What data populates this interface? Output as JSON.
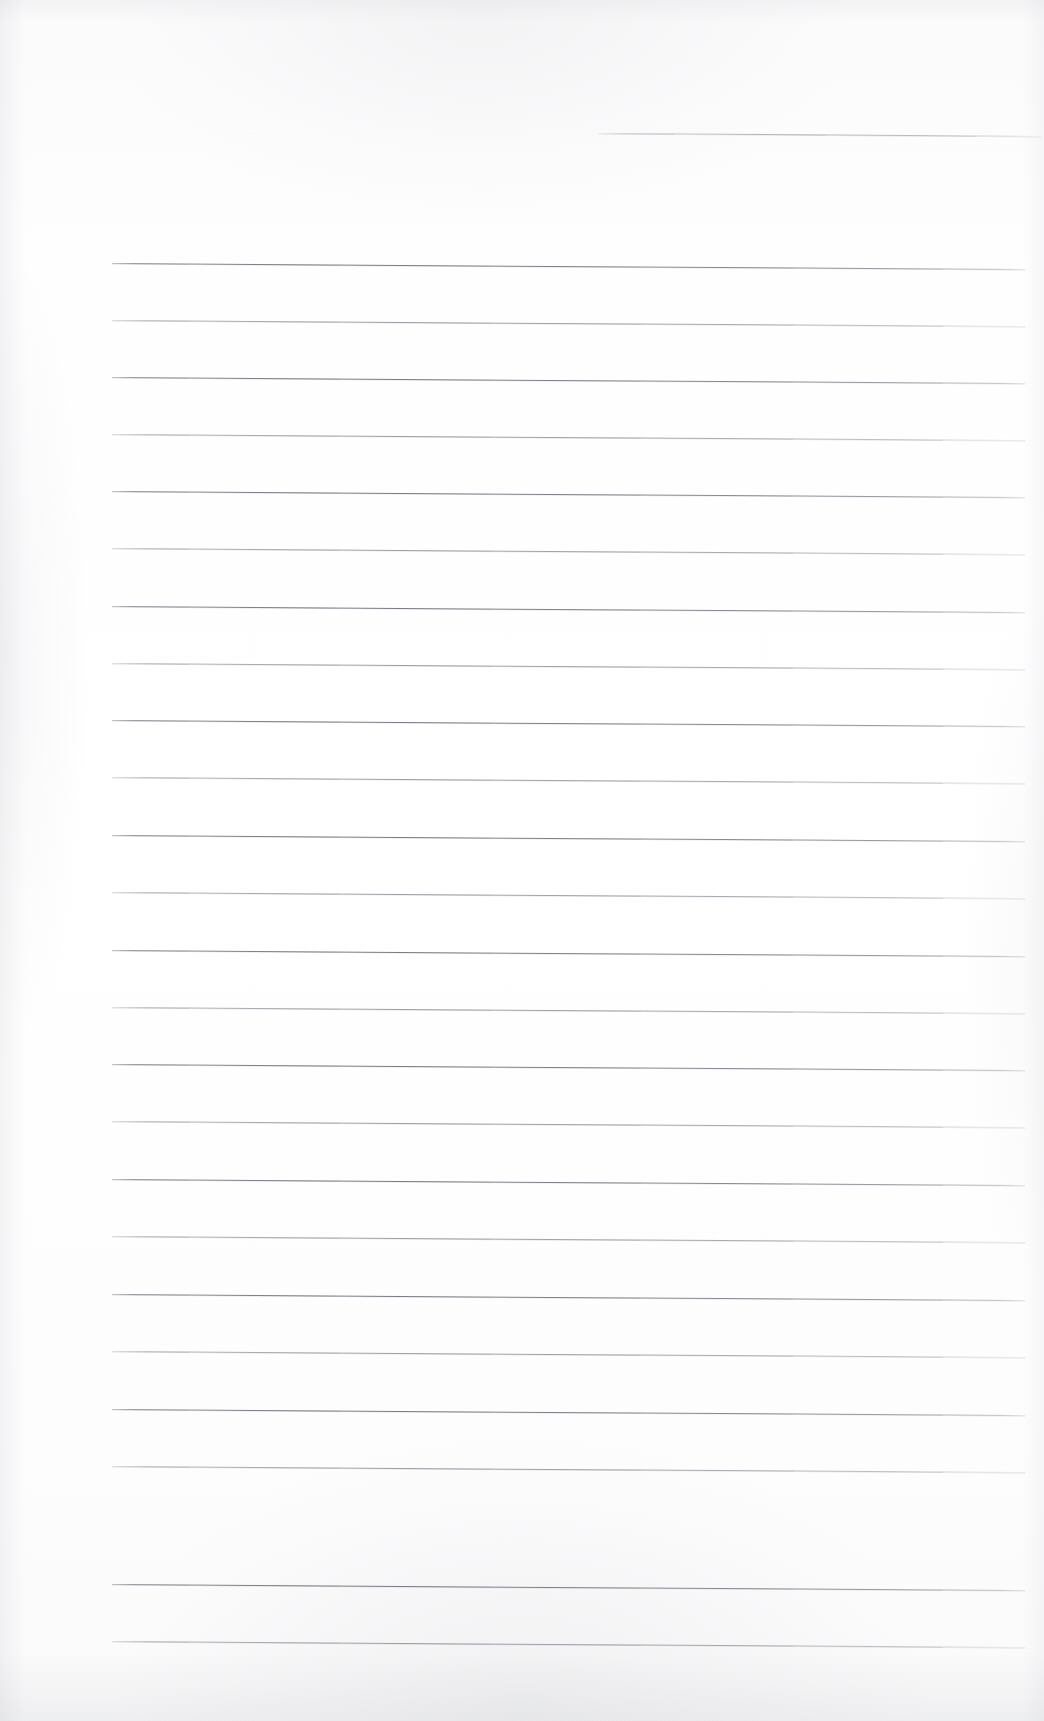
{
  "document": {
    "kind": "scanned-blank-lined-page",
    "page_width": 1044,
    "page_height": 1721,
    "background_color": "#fdfdfe",
    "rule_color": "#82838b",
    "visible_text": "",
    "handwriting": "",
    "notes_text": ""
  },
  "ruling": {
    "line_count": 25,
    "first_line_y": 133,
    "body_first_line_y": 263,
    "body_last_line_y": 1641,
    "line_spacing": 57.4,
    "line_left_x": 112,
    "line_right_x": 1025,
    "line_thickness": 1,
    "skew_degrees": 0.38,
    "partial_top_line_left_x": 598
  },
  "lines": [
    {
      "id": "rule-01",
      "y": 133,
      "x1": 598,
      "x2": 1041,
      "style": "partial"
    },
    {
      "id": "rule-02",
      "y": 263,
      "x1": 112,
      "x2": 1025,
      "style": "solid"
    },
    {
      "id": "rule-03",
      "y": 320,
      "x1": 112,
      "x2": 1025,
      "style": "faded"
    },
    {
      "id": "rule-04",
      "y": 377,
      "x1": 112,
      "x2": 1025,
      "style": "solid"
    },
    {
      "id": "rule-05",
      "y": 434,
      "x1": 112,
      "x2": 1025,
      "style": "faded"
    },
    {
      "id": "rule-06",
      "y": 491,
      "x1": 112,
      "x2": 1025,
      "style": "solid"
    },
    {
      "id": "rule-07",
      "y": 548,
      "x1": 112,
      "x2": 1025,
      "style": "faded"
    },
    {
      "id": "rule-08",
      "y": 606,
      "x1": 112,
      "x2": 1025,
      "style": "solid"
    },
    {
      "id": "rule-09",
      "y": 663,
      "x1": 112,
      "x2": 1025,
      "style": "faded"
    },
    {
      "id": "rule-10",
      "y": 720,
      "x1": 112,
      "x2": 1025,
      "style": "solid"
    },
    {
      "id": "rule-11",
      "y": 777,
      "x1": 112,
      "x2": 1025,
      "style": "faded"
    },
    {
      "id": "rule-12",
      "y": 835,
      "x1": 112,
      "x2": 1025,
      "style": "solid"
    },
    {
      "id": "rule-13",
      "y": 892,
      "x1": 112,
      "x2": 1025,
      "style": "faded"
    },
    {
      "id": "rule-14",
      "y": 950,
      "x1": 112,
      "x2": 1025,
      "style": "solid"
    },
    {
      "id": "rule-15",
      "y": 1007,
      "x1": 112,
      "x2": 1025,
      "style": "faded"
    },
    {
      "id": "rule-16",
      "y": 1064,
      "x1": 112,
      "x2": 1025,
      "style": "solid"
    },
    {
      "id": "rule-17",
      "y": 1121,
      "x1": 112,
      "x2": 1025,
      "style": "faded"
    },
    {
      "id": "rule-18",
      "y": 1179,
      "x1": 112,
      "x2": 1025,
      "style": "solid"
    },
    {
      "id": "rule-19",
      "y": 1236,
      "x1": 112,
      "x2": 1025,
      "style": "faded"
    },
    {
      "id": "rule-20",
      "y": 1294,
      "x1": 112,
      "x2": 1025,
      "style": "solid"
    },
    {
      "id": "rule-21",
      "y": 1351,
      "x1": 112,
      "x2": 1025,
      "style": "faded"
    },
    {
      "id": "rule-22",
      "y": 1409,
      "x1": 112,
      "x2": 1025,
      "style": "solid"
    },
    {
      "id": "rule-23",
      "y": 1466,
      "x1": 112,
      "x2": 1025,
      "style": "faded"
    },
    {
      "id": "rule-24",
      "y": 1584,
      "x1": 112,
      "x2": 1025,
      "style": "solid"
    },
    {
      "id": "rule-25",
      "y": 1641,
      "x1": 112,
      "x2": 1025,
      "style": "faded"
    }
  ]
}
